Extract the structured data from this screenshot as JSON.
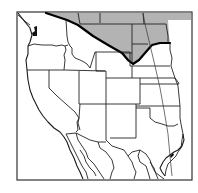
{
  "map": {
    "title": "",
    "type": "outline map",
    "region": "Western United States",
    "colors": {
      "background": "#ffffff",
      "shaded_region": "#b3b3b3",
      "borders": "#222222",
      "highlight_border": "#000000"
    },
    "highlighted_region": {
      "description": "Area north of the thick boundary line, shaded gray",
      "shaded": true
    },
    "features": [
      "frame",
      "shaded-northern-region",
      "thick-boundary-line",
      "state-borders",
      "pacific-coastline",
      "gulf-coastline",
      "mexico-borders",
      "diagonal-meridian-line"
    ]
  }
}
